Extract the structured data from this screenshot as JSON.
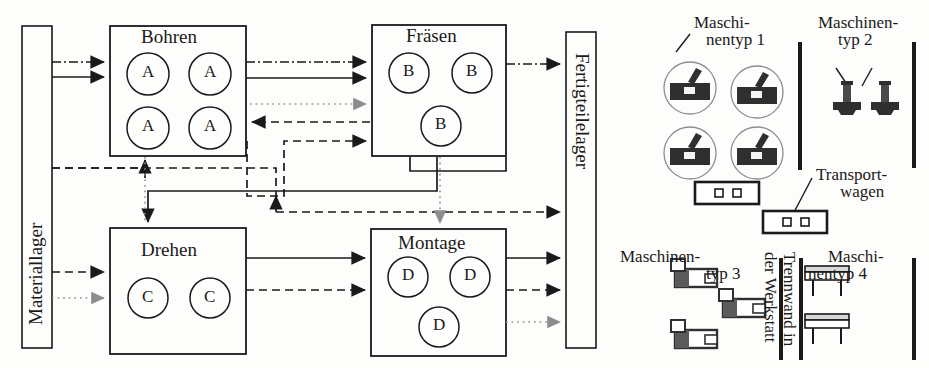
{
  "diagram": {
    "type": "workshop-layout-flow-diagram",
    "title_visible": false,
    "stations": [
      {
        "id": "bohren",
        "label": "Bohren",
        "machine_letter": "A",
        "machine_count": 4,
        "box": {
          "x": 110,
          "y": 26,
          "w": 136,
          "h": 130
        },
        "circles": [
          {
            "cx": 148,
            "cy": 74
          },
          {
            "cx": 210,
            "cy": 74
          },
          {
            "cx": 148,
            "cy": 128
          },
          {
            "cx": 210,
            "cy": 128
          }
        ]
      },
      {
        "id": "fraesen",
        "label": "Fräsen",
        "machine_letter": "B",
        "machine_count": 3,
        "box": {
          "x": 372,
          "y": 25,
          "w": 134,
          "h": 131
        },
        "circles": [
          {
            "cx": 409,
            "cy": 73
          },
          {
            "cx": 472,
            "cy": 73
          },
          {
            "cx": 441,
            "cy": 126
          }
        ]
      },
      {
        "id": "drehen",
        "label": "Drehen",
        "machine_letter": "C",
        "machine_count": 2,
        "box": {
          "x": 110,
          "y": 228,
          "w": 136,
          "h": 126
        },
        "circles": [
          {
            "cx": 148,
            "cy": 298
          },
          {
            "cx": 210,
            "cy": 298
          }
        ]
      },
      {
        "id": "montage",
        "label": "Montage",
        "machine_letter": "D",
        "machine_count": 3,
        "box": {
          "x": 371,
          "y": 229,
          "w": 135,
          "h": 127
        },
        "circles": [
          {
            "cx": 408,
            "cy": 277
          },
          {
            "cx": 470,
            "cy": 277
          },
          {
            "cx": 439,
            "cy": 327
          }
        ]
      }
    ],
    "stores": [
      {
        "id": "materiallager",
        "label": "Materiallager",
        "box": {
          "x": 22,
          "y": 26,
          "w": 30,
          "h": 322
        },
        "text_direction": "bottom-to-top"
      },
      {
        "id": "fertigteilelager",
        "label": "Fertigteilelager",
        "box": {
          "x": 566,
          "y": 32,
          "w": 30,
          "h": 316
        },
        "text_direction": "top-to-bottom"
      }
    ],
    "line_styles": {
      "product_1": "solid",
      "product_2": "dashed",
      "product_3": "dash-dot",
      "product_4": "dotted"
    }
  },
  "legend": {
    "machine_type_1": {
      "label_line1": "Maschi-",
      "label_line2": "nentyp 1",
      "symbol": "machine-type-1-icon",
      "count": 4
    },
    "machine_type_2": {
      "label_line1": "Maschinen-",
      "label_line2": "typ 2",
      "symbol": "machine-type-2-icon",
      "count": 2
    },
    "machine_type_3": {
      "label_line1": "Maschinen-",
      "label_line2": "typ 3",
      "symbol": "machine-type-3-icon",
      "count": 3
    },
    "machine_type_4": {
      "label_line1": "Maschi-",
      "label_line2": "nentyp 4",
      "symbol": "machine-type-4-icon",
      "count": 2
    },
    "transport": {
      "label_line1": "Transport-",
      "label_line2": "wagen",
      "symbol": "transport-cart-icon",
      "count": 2
    },
    "partition": {
      "label_line1": "Trennwand in",
      "label_line2": "der Werkstatt",
      "symbol": "partition-wall-icon",
      "count": 3
    }
  },
  "colors": {
    "ink": "#1a1a1a",
    "paper": "#fdfdfb",
    "faint": "#9a9a9a",
    "icon_fill": "#3a3a3a"
  }
}
